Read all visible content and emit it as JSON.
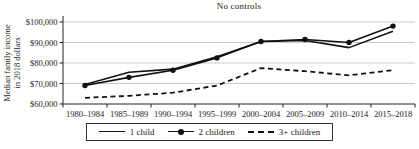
{
  "figure": {
    "title": "No controls",
    "y_axis_label_line1": "Median family income",
    "y_axis_label_line2": "in 2018 dollars"
  },
  "legend": {
    "items": [
      {
        "label": "1 child",
        "style": "solid"
      },
      {
        "label": "2 children",
        "style": "solid-marker"
      },
      {
        "label": "3+ children",
        "style": "dashed"
      }
    ]
  },
  "chart_data": {
    "type": "line",
    "title": "No controls",
    "ylabel": "Median family income in 2018 dollars",
    "xlabel": "",
    "categories": [
      "1980–1984",
      "1985–1989",
      "1990–1994",
      "1995–1999",
      "2000–2004",
      "2005–2009",
      "2010–2014",
      "2015–2018"
    ],
    "series": [
      {
        "name": "1 child",
        "style": "solid",
        "marker": false,
        "values": [
          69500,
          75500,
          77000,
          83000,
          90500,
          91000,
          87500,
          95500
        ]
      },
      {
        "name": "2 children",
        "style": "solid",
        "marker": true,
        "values": [
          69000,
          73000,
          76500,
          82500,
          90500,
          91500,
          90000,
          98000
        ]
      },
      {
        "name": "3+ children",
        "style": "dashed",
        "marker": false,
        "values": [
          63000,
          64000,
          65500,
          69000,
          77500,
          76000,
          74000,
          76500
        ]
      }
    ],
    "ylim": [
      60000,
      100000
    ],
    "yticks": [
      60000,
      70000,
      80000,
      90000,
      100000
    ],
    "ytick_labels": [
      "$60,000",
      "$70,000",
      "$80,000",
      "$90,000",
      "$100,000"
    ],
    "grid": true,
    "legend_position": "bottom",
    "line_color": "#111111",
    "axis_color": "#222222",
    "grid_color": "#c4c4c4"
  }
}
